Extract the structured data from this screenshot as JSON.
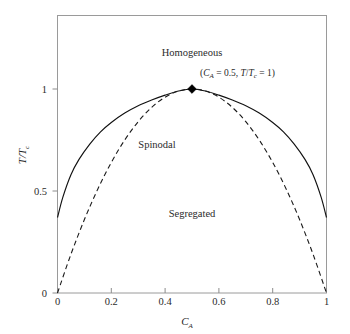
{
  "chart_data": {
    "type": "line",
    "title": "",
    "xlabel": "C_A",
    "xlabel_base": "C",
    "xlabel_sub": "A",
    "ylabel": "T/T_c",
    "ylabel_base_1": "T",
    "ylabel_slash": "/",
    "ylabel_base_2": "T",
    "ylabel_sub": "c",
    "xlim": [
      0,
      1
    ],
    "ylim": [
      0,
      1.25
    ],
    "grid": false,
    "legend": "none",
    "x_ticks": [
      0,
      0.2,
      0.4,
      0.6,
      0.8,
      1
    ],
    "x_tick_labels": [
      "0",
      "0.2",
      "0.4",
      "0.6",
      "0.8",
      "1"
    ],
    "y_ticks": [
      0,
      0.5,
      1
    ],
    "y_tick_labels": [
      "0",
      "0.5",
      "1"
    ],
    "series": [
      {
        "name": "Binodal",
        "style": "solid",
        "color": "#111111",
        "x": [
          0.0,
          0.02,
          0.05,
          0.08,
          0.12,
          0.16,
          0.2,
          0.25,
          0.3,
          0.35,
          0.4,
          0.45,
          0.5,
          0.55,
          0.6,
          0.65,
          0.7,
          0.75,
          0.8,
          0.84,
          0.88,
          0.92,
          0.95,
          0.98,
          1.0
        ],
        "y": [
          0.37,
          0.47,
          0.58,
          0.655,
          0.73,
          0.79,
          0.836,
          0.882,
          0.918,
          0.946,
          0.97,
          0.99,
          1.0,
          0.99,
          0.97,
          0.946,
          0.918,
          0.882,
          0.836,
          0.79,
          0.73,
          0.655,
          0.58,
          0.47,
          0.37
        ]
      },
      {
        "name": "Spinodal",
        "style": "dashed",
        "color": "#1a1a1a",
        "x": [
          0.0,
          0.05,
          0.1,
          0.15,
          0.2,
          0.25,
          0.3,
          0.35,
          0.4,
          0.45,
          0.5,
          0.55,
          0.6,
          0.65,
          0.7,
          0.75,
          0.8,
          0.85,
          0.9,
          0.95,
          1.0
        ],
        "y": [
          0.0,
          0.19,
          0.36,
          0.51,
          0.64,
          0.75,
          0.84,
          0.91,
          0.96,
          0.99,
          1.0,
          0.99,
          0.96,
          0.91,
          0.84,
          0.75,
          0.64,
          0.51,
          0.36,
          0.19,
          0.0
        ]
      }
    ],
    "annotations": [
      {
        "name": "homogeneous-region",
        "text": "Homogeneous",
        "x": 0.5,
        "y": 1.16
      },
      {
        "name": "spinodal-region",
        "text": "Spinodal",
        "x": 0.37,
        "y": 0.71
      },
      {
        "name": "segregated-region",
        "text": "Segregated",
        "x": 0.5,
        "y": 0.375
      }
    ],
    "critical_point": {
      "name": "critical-point",
      "x": 0.5,
      "y": 1.0,
      "marker": "diamond",
      "label_open": "(",
      "label_c": "C",
      "label_c_sub": "A",
      "label_eq1": " = 0.5, ",
      "label_t": "T",
      "label_slash": "/",
      "label_tc": "T",
      "label_tc_sub": "c",
      "label_eq2": " = 1)",
      "label_full": "(C_A = 0.5, T/T_c = 1)"
    }
  }
}
